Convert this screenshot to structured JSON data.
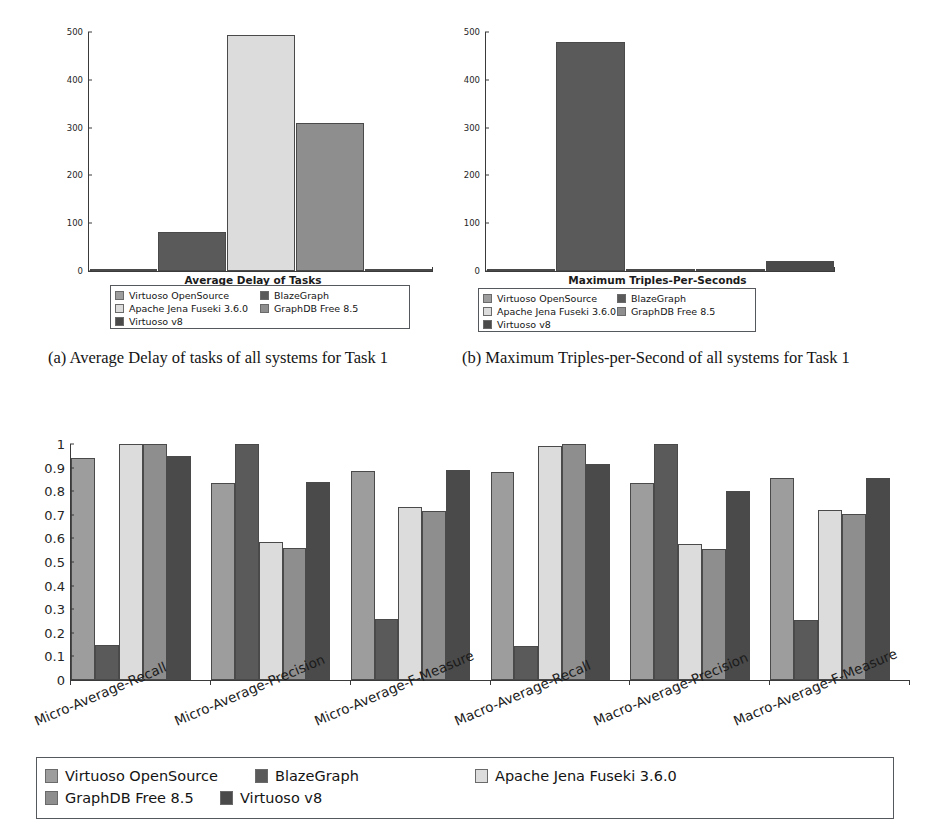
{
  "systems": [
    {
      "name": "Virtuoso OpenSource",
      "color": "#9d9d9d"
    },
    {
      "name": "BlazeGraph",
      "color": "#5a5a5a"
    },
    {
      "name": "Apache Jena Fuseki 3.6.0",
      "color": "#dcdcdc"
    },
    {
      "name": "GraphDB Free 8.5",
      "color": "#8e8e8e"
    },
    {
      "name": "Virtuoso v8",
      "color": "#4a4a4a"
    }
  ],
  "legend_order_small": [
    "Virtuoso OpenSource",
    "BlazeGraph",
    "Apache Jena Fuseki 3.6.0",
    "GraphDB Free 8.5",
    "Virtuoso v8"
  ],
  "captions": {
    "a": "(a) Average Delay of tasks of all systems for Task 1",
    "b": "(b) Maximum Triples-per-Second of all systems for Task 1"
  },
  "chart_data": [
    {
      "id": "fig-a",
      "type": "bar",
      "title": "Average Delay of Tasks",
      "xlabel": "",
      "ylabel": "",
      "ylim": [
        0,
        500
      ],
      "yticks": [
        0,
        100,
        200,
        300,
        400,
        500
      ],
      "categories": [
        "Virtuoso OpenSource",
        "BlazeGraph",
        "Apache Jena Fuseki 3.6.0",
        "GraphDB Free 8.5",
        "Virtuoso v8"
      ],
      "values": [
        1,
        82,
        493,
        309,
        1
      ],
      "grid": false,
      "legend_position": "below"
    },
    {
      "id": "fig-b",
      "type": "bar",
      "title": "Maximum Triples-Per-Seconds",
      "xlabel": "",
      "ylabel": "",
      "ylim": [
        0,
        500
      ],
      "yticks": [
        0,
        100,
        200,
        300,
        400,
        500
      ],
      "categories": [
        "Virtuoso OpenSource",
        "BlazeGraph",
        "Apache Jena Fuseki 3.6.0",
        "GraphDB Free 8.5",
        "Virtuoso v8"
      ],
      "values": [
        2,
        480,
        1,
        3,
        20
      ],
      "grid": false,
      "legend_position": "below"
    },
    {
      "id": "fig-c",
      "type": "bar",
      "title": "",
      "xlabel": "",
      "ylabel": "",
      "ylim": [
        0,
        1
      ],
      "yticks": [
        0,
        0.1,
        0.2,
        0.3,
        0.4,
        0.5,
        0.6,
        0.7,
        0.8,
        0.9,
        1
      ],
      "ytick_labels": [
        "0",
        "0.1",
        "0.2",
        "0.3",
        "0.4",
        "0.5",
        "0.6",
        "0.7",
        "0.8",
        "0.9",
        "1"
      ],
      "categories": [
        "Micro-Average-Recall",
        "Micro-Average-Precision",
        "Micro-Average-F-Measure",
        "Macro-Average-Recall",
        "Macro-Average-Precision",
        "Macro-Average-F-Measure"
      ],
      "series": [
        {
          "name": "Virtuoso OpenSource",
          "color": "#9d9d9d",
          "values": [
            0.94,
            0.835,
            0.885,
            0.88,
            0.835,
            0.855
          ]
        },
        {
          "name": "BlazeGraph",
          "color": "#5a5a5a",
          "values": [
            0.15,
            1.0,
            0.26,
            0.145,
            1.0,
            0.255
          ]
        },
        {
          "name": "Apache Jena Fuseki 3.6.0",
          "color": "#dcdcdc",
          "values": [
            1.0,
            0.585,
            0.735,
            0.99,
            0.575,
            0.72
          ]
        },
        {
          "name": "GraphDB Free 8.5",
          "color": "#8e8e8e",
          "values": [
            1.0,
            0.56,
            0.715,
            1.0,
            0.555,
            0.705
          ]
        },
        {
          "name": "Virtuoso v8",
          "color": "#4a4a4a",
          "values": [
            0.95,
            0.84,
            0.89,
            0.915,
            0.8,
            0.855
          ]
        }
      ],
      "grid": false,
      "legend_position": "below"
    }
  ]
}
